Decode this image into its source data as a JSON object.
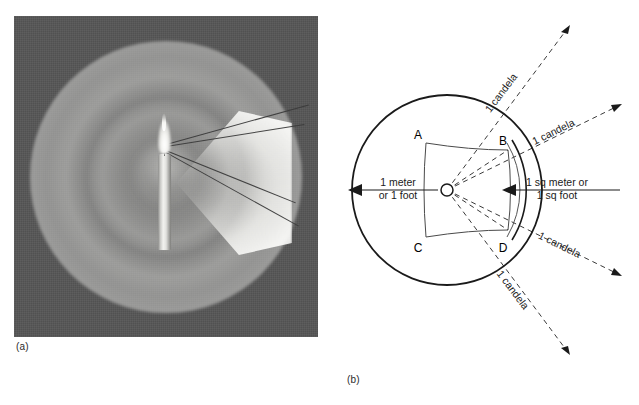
{
  "figure": {
    "panel_a": {
      "caption": "(a)",
      "alt_name": "candle-sphere-photograph"
    },
    "panel_b": {
      "caption": "(b)",
      "alt_name": "candela-geometry-diagram",
      "radius_label_line1": "1 meter",
      "radius_label_line2": "or 1 foot",
      "area_label_line1": "1 sq meter or",
      "area_label_line2": "1 sq foot",
      "point_labels": [
        "A",
        "B",
        "C",
        "D"
      ],
      "candela_rays": [
        {
          "label": "1 candela",
          "angle_deg": -68,
          "text_rotate": -68
        },
        {
          "label": "1 candela",
          "angle_deg": -27,
          "text_rotate": -27
        },
        {
          "label": "1 candela",
          "angle_deg": 27,
          "text_rotate": 27
        },
        {
          "label": "1 candela",
          "angle_deg": 68,
          "text_rotate": 68
        }
      ]
    }
  },
  "colors": {
    "photo_background": "#565656",
    "line": "#1a1a1a",
    "dashed_line": "#3a3a3a",
    "page_background": "#ffffff",
    "glow": "#e8e8e5"
  }
}
